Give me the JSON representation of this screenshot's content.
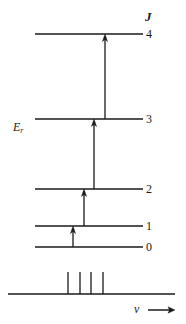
{
  "figure": {
    "background_color": "#ffffff",
    "ink_color": "#1a1a1a",
    "width": 186,
    "height": 324
  },
  "axis_labels": {
    "quantum_number_symbol": "J",
    "energy_symbol_base": "E",
    "energy_symbol_subscript": "r",
    "frequency_symbol": "ν"
  },
  "levels": [
    {
      "label": "4",
      "J": 4,
      "y": 34,
      "x1": 35,
      "x2": 143,
      "label_x": 146,
      "label_y": 28
    },
    {
      "label": "3",
      "J": 3,
      "y": 119,
      "x1": 35,
      "x2": 143,
      "label_x": 146,
      "label_y": 113
    },
    {
      "label": "2",
      "J": 2,
      "y": 189,
      "x1": 35,
      "x2": 143,
      "label_x": 146,
      "label_y": 183
    },
    {
      "label": "1",
      "J": 1,
      "y": 226,
      "x1": 35,
      "x2": 143,
      "label_x": 146,
      "label_y": 220
    },
    {
      "label": "0",
      "J": 0,
      "y": 247,
      "x1": 35,
      "x2": 143,
      "label_x": 146,
      "label_y": 241
    }
  ],
  "transitions": [
    {
      "name": "0-to-1",
      "from_J": 0,
      "to_J": 1,
      "x": 73,
      "y_start": 247,
      "y_end": 226
    },
    {
      "name": "1-to-2",
      "from_J": 1,
      "to_J": 2,
      "x": 84,
      "y_start": 226,
      "y_end": 189
    },
    {
      "name": "2-to-3",
      "from_J": 2,
      "to_J": 3,
      "x": 94,
      "y_start": 189,
      "y_end": 119
    },
    {
      "name": "3-to-4",
      "from_J": 3,
      "to_J": 4,
      "x": 105,
      "y_start": 119,
      "y_end": 34
    }
  ],
  "spectrum": {
    "baseline_y": 294,
    "baseline_x1": 8,
    "baseline_x2": 175,
    "lines": [
      {
        "name": "line-1",
        "x": 68,
        "height": 22
      },
      {
        "name": "line-2",
        "x": 80,
        "height": 22
      },
      {
        "name": "line-3",
        "x": 91,
        "height": 22
      },
      {
        "name": "line-4",
        "x": 103,
        "height": 22
      }
    ],
    "axis_arrow": {
      "x_start": 148,
      "x_end": 175,
      "y": 310
    },
    "axis_label_x": 135,
    "axis_label_y": 304
  },
  "chart_data": {
    "type": "diagram",
    "xlabel": "ν",
    "ylabel": "E_r",
    "categories": [
      "0",
      "1",
      "2",
      "3",
      "4"
    ],
    "series": [
      {
        "name": "Energy levels (relative vertical position, px from top)",
        "values": [
          247,
          226,
          189,
          119,
          34
        ]
      }
    ],
    "annotations": [
      "J",
      "E_r",
      "ν"
    ],
    "legend": "none",
    "grid": false
  }
}
